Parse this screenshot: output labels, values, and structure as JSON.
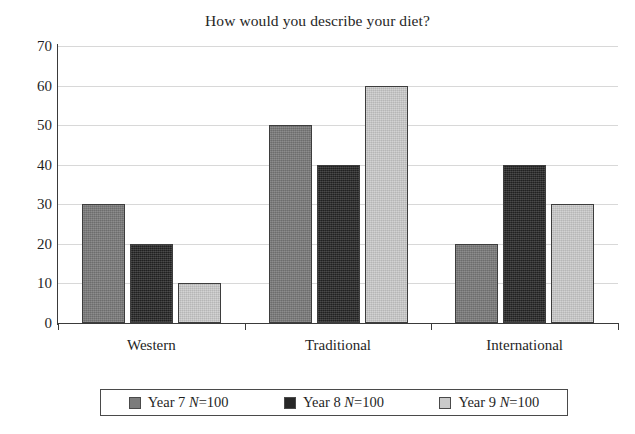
{
  "chart_data": {
    "type": "bar",
    "title": "How would you describe your diet?",
    "xlabel": "",
    "ylabel": "",
    "ylim": [
      0,
      70
    ],
    "ytick_step": 10,
    "yticks": [
      "70",
      "60",
      "50",
      "40",
      "30",
      "20",
      "10",
      "0"
    ],
    "grid": true,
    "legend_position": "bottom",
    "categories": [
      "Western",
      "Traditional",
      "International"
    ],
    "series": [
      {
        "name": "Year 7 N=100",
        "label_prefix": "Year 7 ",
        "label_italic": "N",
        "label_suffix": "=100",
        "color": "#7c7c7c",
        "values": [
          30,
          50,
          20
        ]
      },
      {
        "name": "Year 8 N=100",
        "label_prefix": "Year 8 ",
        "label_italic": "N",
        "label_suffix": "=100",
        "color": "#272727",
        "values": [
          20,
          40,
          40
        ]
      },
      {
        "name": "Year 9 N=100",
        "label_prefix": "Year 9 ",
        "label_italic": "N",
        "label_suffix": "=100",
        "color": "#cacaca",
        "values": [
          10,
          60,
          30
        ]
      }
    ]
  }
}
